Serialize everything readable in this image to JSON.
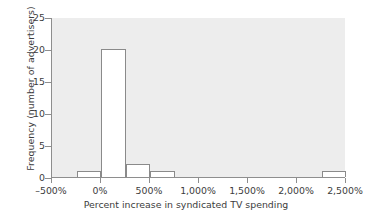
{
  "chart_data": {
    "type": "bar",
    "title": "",
    "xlabel": "Percent increase in syndicated TV spending",
    "ylabel": "Frequency (number of advertisers)",
    "xlim": [
      -500,
      2500
    ],
    "ylim": [
      0,
      25
    ],
    "bin_width": 250,
    "grid": false,
    "legend": null,
    "xticks": [
      -500,
      0,
      500,
      1000,
      1500,
      2000,
      2500
    ],
    "xtick_labels": [
      "–500%",
      "0%",
      "500%",
      "1,000%",
      "1,500%",
      "2,000%",
      "2,500%"
    ],
    "yticks": [
      0,
      5,
      10,
      15,
      20,
      25
    ],
    "ytick_labels": [
      "0",
      "5",
      "10",
      "15",
      "20",
      "25"
    ],
    "bins": [
      {
        "label": "–250% to 0%",
        "x0": -250,
        "x1": 0,
        "value": 1
      },
      {
        "label": "0% to 250%",
        "x0": 0,
        "x1": 250,
        "value": 20
      },
      {
        "label": "250% to 500%",
        "x0": 250,
        "x1": 500,
        "value": 2
      },
      {
        "label": "500% to 750%",
        "x0": 500,
        "x1": 750,
        "value": 1
      },
      {
        "label": "2,250% to 2,500%",
        "x0": 2250,
        "x1": 2500,
        "value": 1
      }
    ],
    "categories": [
      "–250% to 0%",
      "0% to 250%",
      "250% to 500%",
      "500% to 750%",
      "2,250% to 2,500%"
    ],
    "values": [
      1,
      20,
      2,
      1,
      1
    ],
    "colors": {
      "panel_background": "#ededed",
      "bar_fill": "#ffffff",
      "bar_edge": "#8a8a8a",
      "axis": "#8e8e8e",
      "text": "#3c3c3c",
      "figure_background": "#ffffff"
    }
  }
}
